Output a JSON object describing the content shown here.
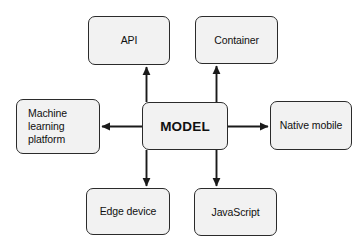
{
  "diagram": {
    "type": "hub-and-spoke",
    "background_color": "#ffffff",
    "node_fill_color": "#f2f2f2",
    "node_border_color": "#2b2b2b",
    "arrow_color": "#1a1a1a",
    "center": {
      "id": "model",
      "label": "MODEL"
    },
    "nodes": [
      {
        "id": "api",
        "label": "API",
        "position": "top-left"
      },
      {
        "id": "container",
        "label": "Container",
        "position": "top-right"
      },
      {
        "id": "ml-platform",
        "label": "Machine\nlearning\nplatform",
        "position": "left"
      },
      {
        "id": "native-mobile",
        "label": "Native mobile",
        "position": "right"
      },
      {
        "id": "edge-device",
        "label": "Edge device",
        "position": "bottom-left"
      },
      {
        "id": "javascript",
        "label": "JavaScript",
        "position": "bottom-right"
      }
    ],
    "edges": [
      {
        "from": "model",
        "to": "api",
        "direction": "up"
      },
      {
        "from": "model",
        "to": "container",
        "direction": "up"
      },
      {
        "from": "model",
        "to": "ml-platform",
        "direction": "left"
      },
      {
        "from": "model",
        "to": "native-mobile",
        "direction": "right"
      },
      {
        "from": "model",
        "to": "edge-device",
        "direction": "down"
      },
      {
        "from": "model",
        "to": "javascript",
        "direction": "down"
      }
    ]
  }
}
